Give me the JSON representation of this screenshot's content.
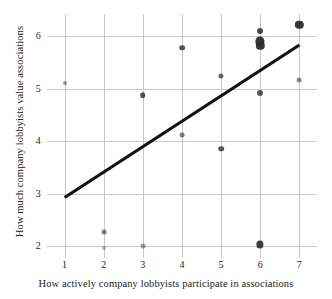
{
  "chart_data": {
    "type": "scatter",
    "title": "",
    "xlabel": "How actively company lobbyists participate in associations",
    "ylabel": "How much company lobbyists value associations",
    "xlim": [
      0.55,
      7.45
    ],
    "ylim": [
      1.78,
      6.42
    ],
    "xticks": [
      1,
      2,
      3,
      4,
      5,
      6,
      7
    ],
    "yticks": [
      2,
      3,
      4,
      5,
      6
    ],
    "xtick_labels": [
      "1",
      "2",
      "3",
      "4",
      "5",
      "6",
      "7"
    ],
    "ytick_labels": [
      "2",
      "3",
      "4",
      "5",
      "6"
    ],
    "grid": true,
    "grid_color": "#c9c9c9",
    "legend": "none",
    "point_color": "#2b2b2b",
    "line_color": "#111111",
    "points": [
      {
        "x": 1,
        "y": 5.1,
        "size": 2.0,
        "opacity": 0.5
      },
      {
        "x": 2,
        "y": 2.28,
        "size": 2.4,
        "opacity": 0.6
      },
      {
        "x": 2,
        "y": 1.97,
        "size": 2.0,
        "opacity": 0.35
      },
      {
        "x": 3,
        "y": 4.88,
        "size": 2.8,
        "opacity": 0.8
      },
      {
        "x": 3,
        "y": 2.0,
        "size": 2.4,
        "opacity": 0.45
      },
      {
        "x": 4,
        "y": 5.78,
        "size": 2.8,
        "opacity": 0.8
      },
      {
        "x": 4,
        "y": 4.12,
        "size": 2.4,
        "opacity": 0.6
      },
      {
        "x": 5,
        "y": 5.25,
        "size": 2.6,
        "opacity": 0.7
      },
      {
        "x": 5,
        "y": 3.86,
        "size": 2.8,
        "opacity": 0.8
      },
      {
        "x": 6,
        "y": 6.1,
        "size": 3.0,
        "opacity": 0.85
      },
      {
        "x": 6,
        "y": 5.9,
        "size": 4.6,
        "opacity": 0.95
      },
      {
        "x": 6,
        "y": 5.82,
        "size": 4.2,
        "opacity": 0.95
      },
      {
        "x": 6,
        "y": 4.92,
        "size": 3.0,
        "opacity": 0.8
      },
      {
        "x": 6,
        "y": 2.04,
        "size": 3.6,
        "opacity": 0.9
      },
      {
        "x": 7,
        "y": 6.22,
        "size": 4.2,
        "opacity": 0.95
      },
      {
        "x": 7,
        "y": 5.17,
        "size": 2.4,
        "opacity": 0.55
      }
    ],
    "fit_line": {
      "type": "linear",
      "x_start": 1,
      "y_start": 2.93,
      "x_end": 7,
      "y_end": 5.83,
      "width": 3.2
    }
  }
}
